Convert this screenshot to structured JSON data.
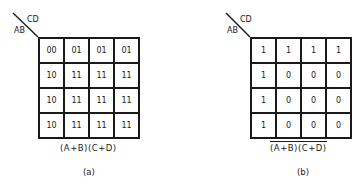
{
  "diagrams": [
    {
      "id": "a",
      "corner_row_label": "AB",
      "corner_col_label": "CD",
      "cells": [
        [
          "00",
          "01",
          "01",
          "01"
        ],
        [
          "10",
          "11",
          "11",
          "11"
        ],
        [
          "10",
          "11",
          "11",
          "11"
        ],
        [
          "10",
          "11",
          "11",
          "11"
        ]
      ],
      "expression": "(A+B)(C+D)",
      "expression_overlined": false,
      "caption": "(a)"
    },
    {
      "id": "b",
      "corner_row_label": "AB",
      "corner_col_label": "CD",
      "cells": [
        [
          "1",
          "1",
          "1",
          "1"
        ],
        [
          "1",
          "0",
          "0",
          "0"
        ],
        [
          "1",
          "0",
          "0",
          "0"
        ],
        [
          "1",
          "0",
          "0",
          "0"
        ]
      ],
      "expression": "(A+B)(C+D)",
      "expression_overlined": true,
      "caption": "(b)"
    }
  ]
}
